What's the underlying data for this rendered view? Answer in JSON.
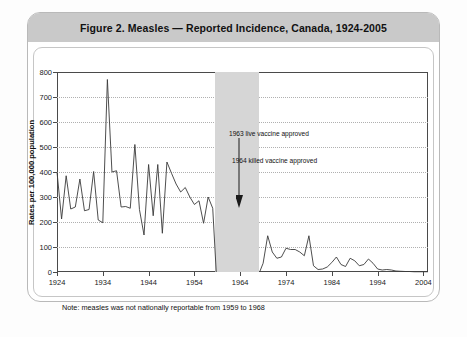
{
  "figure": {
    "title": "Figure 2.  Measles — Reported Incidence, Canada, 1924-2005",
    "note": "Note: measles was not nationally reportable from 1959 to 1968"
  },
  "chart_data": {
    "type": "line",
    "title": "Figure 2.  Measles — Reported Incidence, Canada, 1924-2005",
    "xlabel": "",
    "ylabel": "Rates per 100,000 population",
    "xlim": [
      1924,
      2005
    ],
    "ylim": [
      0,
      800
    ],
    "ytick_labels": [
      "0",
      "100",
      "200",
      "300",
      "400",
      "500",
      "600",
      "700",
      "800"
    ],
    "yticks": [
      0,
      100,
      200,
      300,
      400,
      500,
      600,
      700,
      800
    ],
    "xtick_labels": [
      "1924",
      "1934",
      "1944",
      "1954",
      "1964",
      "1974",
      "1984",
      "1994",
      "2004"
    ],
    "xticks": [
      1924,
      1934,
      1944,
      1954,
      1964,
      1974,
      1984,
      1994,
      2004
    ],
    "grid": "horizontal-dotted",
    "legend": "none",
    "line_color": "#3a3a3a",
    "shaded_band": {
      "label": "not nationally reportable",
      "x_start": 1958.5,
      "x_end": 1968.2,
      "color": "#d6d6d6"
    },
    "annotations": [
      {
        "text": "1963 live vaccine approved",
        "x": 1963,
        "y": 430
      },
      {
        "text": "1964 killed vaccine approved",
        "x": 1964,
        "y": 350
      }
    ],
    "x": [
      1924,
      1925,
      1926,
      1927,
      1928,
      1929,
      1930,
      1931,
      1932,
      1933,
      1934,
      1935,
      1936,
      1937,
      1938,
      1939,
      1940,
      1941,
      1942,
      1943,
      1944,
      1945,
      1946,
      1947,
      1948,
      1949,
      1950,
      1951,
      1952,
      1953,
      1954,
      1955,
      1956,
      1957,
      1958,
      1969,
      1970,
      1971,
      1972,
      1973,
      1974,
      1975,
      1976,
      1977,
      1978,
      1979,
      1980,
      1981,
      1982,
      1983,
      1984,
      1985,
      1986,
      1987,
      1988,
      1989,
      1990,
      1991,
      1992,
      1993,
      1994,
      1995,
      1996,
      1997,
      1998,
      1999,
      2000,
      2001,
      2002,
      2003,
      2004,
      2005
    ],
    "values": [
      400,
      212,
      385,
      252,
      260,
      372,
      245,
      250,
      402,
      208,
      197,
      770,
      400,
      405,
      260,
      262,
      255,
      510,
      250,
      148,
      430,
      225,
      430,
      155,
      440,
      395,
      352,
      320,
      338,
      300,
      270,
      285,
      195,
      300,
      255,
      35,
      145,
      80,
      55,
      60,
      95,
      90,
      90,
      80,
      65,
      145,
      25,
      10,
      12,
      20,
      38,
      60,
      30,
      22,
      55,
      45,
      25,
      30,
      52,
      35,
      12,
      8,
      10,
      8,
      4,
      3,
      2,
      2,
      1,
      1,
      1,
      1
    ],
    "values_note": "Rates per 100,000 population; 1959-1968 missing (not nationally reportable)"
  }
}
